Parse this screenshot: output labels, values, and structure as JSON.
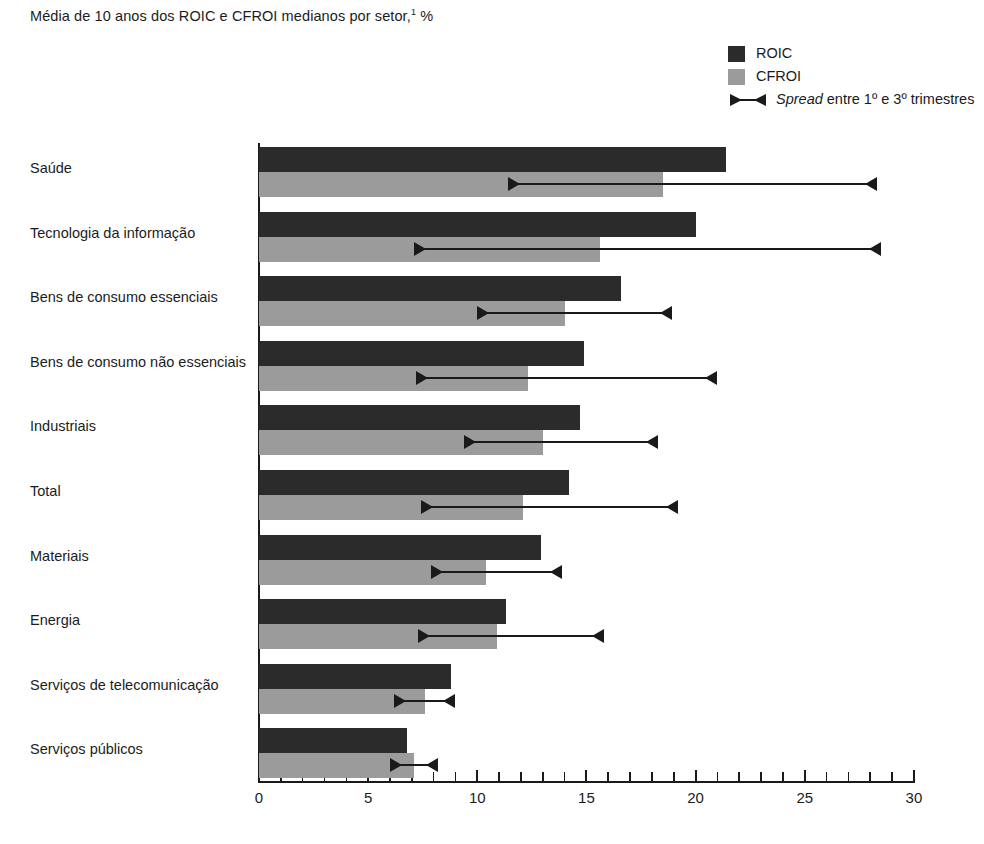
{
  "chart_data": {
    "type": "bar",
    "orientation": "horizontal",
    "title": "Média de 10 anos dos ROIC e CFROI medianos por setor,",
    "title_footnote_marker": "1",
    "title_unit": "%",
    "xlabel": "",
    "ylabel": "",
    "xlim": [
      0,
      30
    ],
    "xticks": [
      0,
      5,
      10,
      15,
      20,
      25,
      30
    ],
    "xtick_labels": [
      "0",
      "5",
      "10",
      "15",
      "20",
      "25",
      "30"
    ],
    "minor_tick_step": 1,
    "grid": false,
    "legend_position": "top-right",
    "categories": [
      "Saúde",
      "Tecnologia da informação",
      "Bens de consumo essenciais",
      "Bens de consumo não essenciais",
      "Industriais",
      "Total",
      "Materiais",
      "Energia",
      "Serviços de telecomunicação",
      "Serviços públicos"
    ],
    "series": [
      {
        "name": "ROIC",
        "color": "#2b2b2b",
        "values": [
          21.4,
          20.0,
          16.6,
          14.9,
          14.7,
          14.2,
          12.9,
          11.3,
          8.8,
          6.8
        ]
      },
      {
        "name": "CFROI",
        "color": "#9b9b9b",
        "values": [
          18.5,
          15.6,
          14.0,
          12.3,
          13.0,
          12.1,
          10.4,
          10.9,
          7.6,
          7.1
        ]
      }
    ],
    "spread": {
      "name": "Spread entre 1º e 3º trimestres",
      "color": "#1a1a1a",
      "q1": [
        11.4,
        7.1,
        10.0,
        7.2,
        9.4,
        7.4,
        7.9,
        7.3,
        6.2,
        6.0
      ],
      "q3": [
        28.3,
        28.5,
        18.9,
        21.0,
        18.3,
        19.2,
        13.9,
        15.8,
        9.0,
        8.2
      ]
    }
  },
  "legend": {
    "items": [
      {
        "label": "ROIC",
        "type": "swatch",
        "color": "#2b2b2b"
      },
      {
        "label": "CFROI",
        "type": "swatch",
        "color": "#9b9b9b"
      },
      {
        "label_italic": "Spread",
        "label_rest": " entre 1º e 3º trimestres",
        "type": "marker",
        "color": "#1a1a1a"
      }
    ]
  }
}
